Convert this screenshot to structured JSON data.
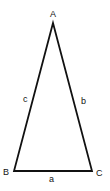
{
  "diagram": {
    "type": "isosceles-triangle",
    "stroke_color": "#111111",
    "background": "#ffffff",
    "vertices": [
      {
        "name": "A",
        "x": 53,
        "y": 23
      },
      {
        "name": "B",
        "x": 14,
        "y": 171
      },
      {
        "name": "C",
        "x": 92,
        "y": 171
      }
    ],
    "vertex_labels": {
      "A": "A",
      "B": "B",
      "C": "C"
    },
    "side_labels": {
      "a": "a",
      "b": "b",
      "c": "c"
    }
  }
}
